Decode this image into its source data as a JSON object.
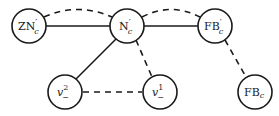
{
  "diagram": {
    "type": "graph",
    "nodes": [
      {
        "id": "ZNc_prime",
        "main": "ZN",
        "prime": "′",
        "sub": "c",
        "sup": "",
        "x": 29,
        "y": 26
      },
      {
        "id": "Nc_prime",
        "main": "N",
        "prime": "′",
        "sub": "c",
        "sup": "",
        "x": 127,
        "y": 26
      },
      {
        "id": "FBc_prime",
        "main": "FB",
        "prime": "′",
        "sub": "c",
        "sup": "",
        "x": 215,
        "y": 26
      },
      {
        "id": "v2_minus",
        "main": "v",
        "prime": "",
        "sub": "−",
        "sup": "2",
        "x": 65,
        "y": 92
      },
      {
        "id": "v1_minus",
        "main": "v",
        "prime": "",
        "sub": "−",
        "sup": "1",
        "x": 160,
        "y": 92
      },
      {
        "id": "FBc",
        "main": "FB",
        "prime": "",
        "sub": "c",
        "sup": "",
        "x": 255,
        "y": 92
      }
    ],
    "edges": [
      {
        "from": "ZNc_prime",
        "to": "Nc_prime",
        "style": "solid",
        "shape": "line"
      },
      {
        "from": "ZNc_prime",
        "to": "Nc_prime",
        "style": "dashed",
        "shape": "arc"
      },
      {
        "from": "Nc_prime",
        "to": "FBc_prime",
        "style": "solid",
        "shape": "line"
      },
      {
        "from": "Nc_prime",
        "to": "FBc_prime",
        "style": "dashed",
        "shape": "arc"
      },
      {
        "from": "Nc_prime",
        "to": "v2_minus",
        "style": "solid",
        "shape": "line"
      },
      {
        "from": "Nc_prime",
        "to": "v1_minus",
        "style": "dashed",
        "shape": "line"
      },
      {
        "from": "v2_minus",
        "to": "v1_minus",
        "style": "dashed",
        "shape": "line"
      },
      {
        "from": "FBc_prime",
        "to": "FBc",
        "style": "dashed",
        "shape": "line"
      }
    ]
  },
  "labels": {
    "zn_main": "ZN",
    "zn_prime": "′",
    "zn_sub": "c",
    "n_main": "N",
    "n_prime": "′",
    "n_sub": "c",
    "fbp_main": "FB",
    "fbp_prime": "′",
    "fbp_sub": "c",
    "v2_main": "v",
    "v2_sup": "2",
    "v2_sub": "−",
    "v1_main": "v",
    "v1_sup": "1",
    "v1_sub": "−",
    "fb_main": "FB",
    "fb_sub": "c"
  }
}
